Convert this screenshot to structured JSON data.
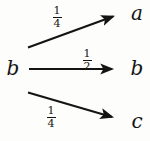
{
  "figure": {
    "type": "state-transition-diagram",
    "source": {
      "label": "b"
    },
    "transitions": [
      {
        "target": "a",
        "weight_numerator": "1",
        "weight_denominator": "4",
        "weight_text": "1/4",
        "weight_value": 0.25,
        "direction": "up"
      },
      {
        "target": "b",
        "weight_numerator": "1",
        "weight_denominator": "2",
        "weight_text": "1/2",
        "weight_value": 0.5,
        "direction": "horizontal"
      },
      {
        "target": "c",
        "weight_numerator": "1",
        "weight_denominator": "4",
        "weight_text": "1/4",
        "weight_value": 0.25,
        "direction": "down"
      }
    ],
    "colors": {
      "ink": "#141414",
      "paper": "#fdfdfb"
    }
  }
}
